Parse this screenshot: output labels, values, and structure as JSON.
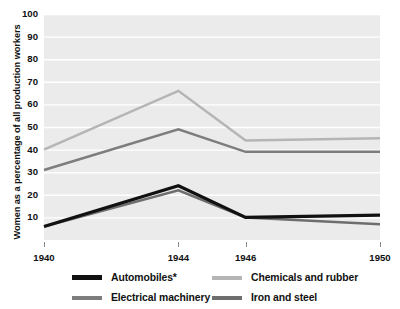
{
  "chart_data": {
    "type": "line",
    "title": "",
    "xlabel": "",
    "ylabel": "Women as a percentage of all production workers",
    "x": [
      1940,
      1944,
      1946,
      1950
    ],
    "xtick_labels": [
      "1940",
      "1944",
      "1946",
      "1950"
    ],
    "ytick_labels": [
      "10",
      "20",
      "30",
      "40",
      "50",
      "60",
      "70",
      "80",
      "90",
      "100"
    ],
    "ylim": [
      0,
      100
    ],
    "ytick_step": 10,
    "grid": true,
    "grid_axis": "y",
    "legend_position": "bottom",
    "plot_background": "#ebebeb",
    "series": [
      {
        "name": "Automobiles*",
        "color": "#111111",
        "values": [
          6,
          24,
          10,
          11
        ]
      },
      {
        "name": "Electrical machinery",
        "color": "#7d7d7d",
        "values": [
          31,
          49,
          39,
          39
        ]
      },
      {
        "name": "Chemicals and rubber",
        "color": "#b5b5b5",
        "values": [
          40,
          66,
          44,
          45
        ]
      },
      {
        "name": "Iron and steel",
        "color": "#6e6e6e",
        "values": [
          6,
          22,
          10,
          7
        ]
      }
    ]
  },
  "legend": {
    "items": [
      {
        "label": "Automobiles*",
        "color": "#111111"
      },
      {
        "label": "Chemicals and rubber",
        "color": "#b5b5b5"
      },
      {
        "label": "Electrical machinery",
        "color": "#7d7d7d"
      },
      {
        "label": "Iron and steel",
        "color": "#6e6e6e"
      }
    ]
  }
}
